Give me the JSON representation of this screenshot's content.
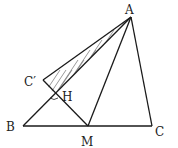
{
  "diagram": {
    "type": "geometry-triangle-fold",
    "points": {
      "A": {
        "label": "A",
        "x": 131,
        "y": 17
      },
      "B": {
        "label": "B",
        "x": 23,
        "y": 126
      },
      "C": {
        "label": "C",
        "x": 152,
        "y": 126
      },
      "M": {
        "label": "M",
        "x": 88,
        "y": 126
      },
      "Cp": {
        "label": "C′",
        "x": 43,
        "y": 80
      },
      "H": {
        "label": "H",
        "x": 54,
        "y": 94
      }
    },
    "segments": [
      "AB",
      "AC",
      "BC",
      "AM",
      "AC′",
      "C′M"
    ],
    "shaded_region": "triangle A C′ H (hatched)",
    "right_angle_at": "H"
  }
}
